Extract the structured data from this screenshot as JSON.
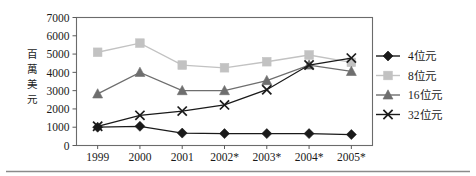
{
  "chart_data": {
    "type": "line",
    "title": "",
    "subtitle": "",
    "xlabel": "",
    "ylabel": "百萬美元",
    "ylabel_chars": [
      "百",
      "萬",
      "美",
      "元"
    ],
    "categories": [
      "1999",
      "2000",
      "2001",
      "2002*",
      "2003*",
      "2004*",
      "2005*"
    ],
    "ylim": [
      0,
      7000
    ],
    "ytick_labels": [
      "0",
      "1000",
      "2000",
      "3000",
      "4000",
      "5000",
      "6000",
      "7000"
    ],
    "ytick_values": [
      0,
      1000,
      2000,
      3000,
      4000,
      5000,
      6000,
      7000
    ],
    "grid": false,
    "legend_position": "right",
    "series": [
      {
        "name": "4位元",
        "marker": "diamond",
        "color": "#1a1a1a",
        "line_color": "#1a1a1a",
        "values": [
          1000,
          1050,
          680,
          650,
          650,
          650,
          600
        ]
      },
      {
        "name": "8位元",
        "marker": "square",
        "color": "#c2c2c2",
        "line_color": "#c2c2c2",
        "values": [
          5100,
          5600,
          4400,
          4250,
          4580,
          4950,
          4550
        ]
      },
      {
        "name": "16位元",
        "marker": "triangle",
        "color": "#6e6e6e",
        "line_color": "#6e6e6e",
        "values": [
          2820,
          4000,
          3000,
          3000,
          3550,
          4400,
          4050
        ]
      },
      {
        "name": "32位元",
        "marker": "x",
        "color": "#1a1a1a",
        "line_color": "#1a1a1a",
        "values": [
          1050,
          1650,
          1880,
          2220,
          3050,
          4400,
          4780
        ]
      }
    ]
  },
  "legend": {
    "entries": [
      {
        "label": "4位元",
        "marker": "diamond-marker",
        "color": "#1a1a1a"
      },
      {
        "label": "8位元",
        "marker": "square-marker",
        "color": "#c2c2c2"
      },
      {
        "label": "16位元",
        "marker": "triangle-marker",
        "color": "#6e6e6e"
      },
      {
        "label": "32位元",
        "marker": "x-marker",
        "color": "#1a1a1a"
      }
    ]
  },
  "colors": {
    "frame": "#6b6b6b",
    "text": "#1a1a1a",
    "background": "#ffffff",
    "rule": "#8a8a8a"
  }
}
